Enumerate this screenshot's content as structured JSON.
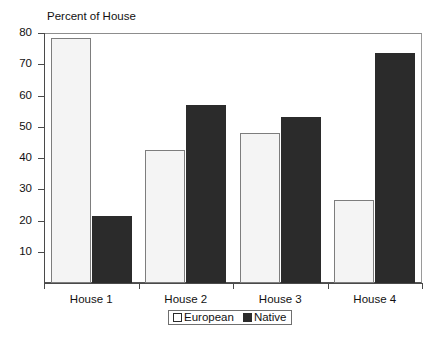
{
  "chart_data": {
    "type": "bar",
    "title": "Percent of House",
    "xlabel": "",
    "ylabel": "",
    "categories": [
      "House 1",
      "House 2",
      "House 3",
      "House 4"
    ],
    "series": [
      {
        "name": "European",
        "values": [
          78.5,
          42.5,
          48,
          26.5
        ],
        "color": "#f4f4f4"
      },
      {
        "name": "Native",
        "values": [
          21.5,
          57,
          53,
          73.5
        ],
        "color": "#2b2b2b"
      }
    ],
    "ylim": [
      0,
      80
    ],
    "yticks": [
      10,
      20,
      30,
      40,
      50,
      60,
      70,
      80
    ],
    "ytick_labels": [
      "10",
      "20",
      "30",
      "40",
      "50",
      "60",
      "70",
      "80"
    ],
    "grid": false,
    "legend_position": "bottom-center"
  },
  "legend": {
    "entries": [
      {
        "label": "European"
      },
      {
        "label": "Native"
      }
    ]
  }
}
